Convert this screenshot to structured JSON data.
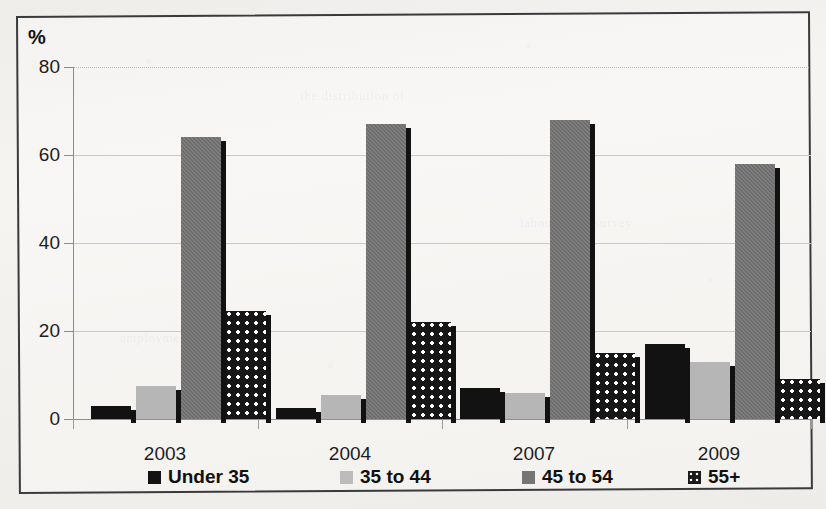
{
  "chart_data": {
    "type": "bar",
    "title": "",
    "xlabel": "",
    "ylabel": "%",
    "ylim": [
      0,
      80
    ],
    "yticks": [
      0,
      20,
      40,
      60,
      80
    ],
    "grid": true,
    "legend_position": "bottom",
    "categories": [
      "2003",
      "2004",
      "2007",
      "2009"
    ],
    "series": [
      {
        "name": "Under 35",
        "color": "#121212",
        "values": [
          3,
          2.5,
          7,
          17
        ]
      },
      {
        "name": "35 to 44",
        "color": "#b6b6b6",
        "values": [
          7.5,
          5.5,
          6,
          13
        ]
      },
      {
        "name": "45 to 54",
        "color": "#6e6e6e",
        "values": [
          64,
          67,
          68,
          58
        ]
      },
      {
        "name": "55+",
        "color": "#171717",
        "values": [
          24.5,
          22,
          15,
          9
        ]
      }
    ]
  },
  "axis": {
    "unit_label": "%",
    "y_tick_labels": [
      "80",
      "60",
      "40",
      "20",
      "0"
    ],
    "x_tick_labels": [
      "2003",
      "2004",
      "2007",
      "2009"
    ]
  },
  "legend": {
    "items": [
      {
        "label": "Under 35",
        "swatch": "black-square-icon"
      },
      {
        "label": "35 to 44",
        "swatch": "light-gray-square-icon"
      },
      {
        "label": "45 to 54",
        "swatch": "dark-gray-square-icon"
      },
      {
        "label": "55+",
        "swatch": "dotted-square-icon"
      }
    ]
  },
  "page": {
    "bleed_text": [
      "the distribution of",
      "employment by age",
      "labour force survey"
    ]
  }
}
